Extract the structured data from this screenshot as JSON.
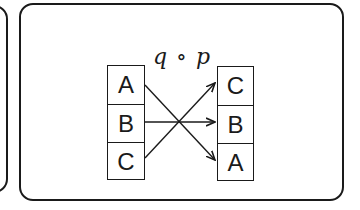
{
  "diagram": {
    "label": "q ∘ p",
    "source_column": {
      "cells": [
        "A",
        "B",
        "C"
      ]
    },
    "target_column": {
      "cells": [
        "C",
        "B",
        "A"
      ]
    },
    "mappings": [
      {
        "from": "A",
        "to": "A"
      },
      {
        "from": "B",
        "to": "B"
      },
      {
        "from": "C",
        "to": "C"
      }
    ],
    "colors": {
      "stroke": "#1a1a1a",
      "background": "#ffffff"
    }
  }
}
